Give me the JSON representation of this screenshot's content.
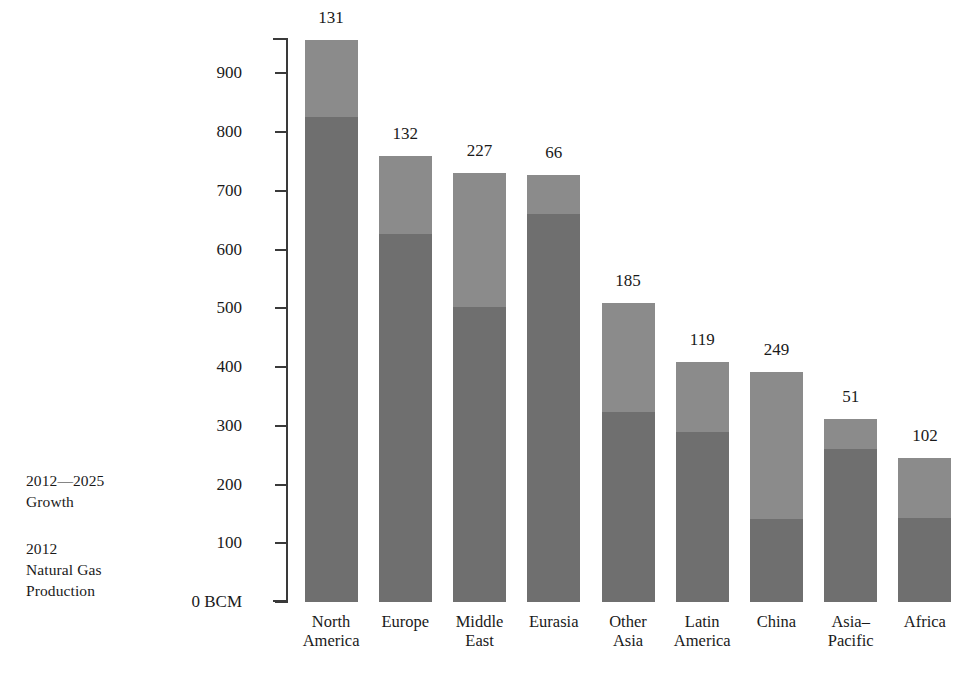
{
  "chart_data": {
    "type": "bar",
    "subtype": "stacked-bar",
    "title": "",
    "xlabel": "",
    "ylabel": "",
    "unit": "BCM",
    "ylim": [
      0,
      960
    ],
    "grid": false,
    "legend_position": "left",
    "axis": {
      "zero_label": "0 BCM",
      "tick_values": [
        0,
        100,
        200,
        300,
        400,
        500,
        600,
        700,
        800,
        900
      ],
      "tick_labels": [
        "0 BCM",
        "100",
        "200",
        "300",
        "400",
        "500",
        "600",
        "700",
        "800",
        "900"
      ]
    },
    "categories": [
      "North America",
      "Europe",
      "Middle East",
      "Eurasia",
      "Other Asia",
      "Latin America",
      "China",
      "Asia–Pacific",
      "Africa"
    ],
    "category_lines": [
      [
        "North",
        "America"
      ],
      [
        "Europe",
        ""
      ],
      [
        "Middle",
        "East"
      ],
      [
        "Eurasia",
        ""
      ],
      [
        "Other",
        "Asia"
      ],
      [
        "Latin",
        "America"
      ],
      [
        "China",
        ""
      ],
      [
        "Asia–",
        "Pacific"
      ],
      [
        "Africa",
        ""
      ]
    ],
    "series": [
      {
        "name": "2012 Natural Gas Production",
        "color": "#6f6f6f",
        "values": [
          825,
          627,
          503,
          660,
          324,
          289,
          142,
          261,
          143
        ]
      },
      {
        "name": "2012—2025 Growth",
        "color": "#8b8b8b",
        "values": [
          131,
          132,
          227,
          66,
          185,
          119,
          249,
          51,
          102
        ]
      }
    ],
    "totals": [
      956,
      759,
      730,
      726,
      509,
      408,
      391,
      312,
      245
    ],
    "data_labels": [
      "131",
      "132",
      "227",
      "66",
      "185",
      "119",
      "249",
      "51",
      "102"
    ],
    "data_label_meaning": "2012—2025 Growth (BCM)"
  },
  "legend": {
    "entries": [
      {
        "line1": "2012—2025",
        "line2": "Growth",
        "color": "#8b8b8b"
      },
      {
        "line1": "2012",
        "line2": "Natural Gas",
        "line3": "Production",
        "color": "#6f6f6f"
      }
    ]
  },
  "colors": {
    "growth": "#8b8b8b",
    "production": "#6f6f6f",
    "axis": "#3a3a3a",
    "text": "#1a1a1a",
    "background": "#ffffff"
  }
}
